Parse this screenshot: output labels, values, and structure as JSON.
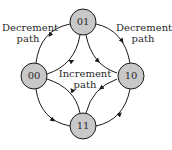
{
  "diagram": {
    "nodes": [
      {
        "id": "01",
        "label": "01"
      },
      {
        "id": "00",
        "label": "00"
      },
      {
        "id": "10",
        "label": "10"
      },
      {
        "id": "11",
        "label": "11"
      }
    ],
    "labels": {
      "decrement_left_1": "Decrement",
      "decrement_left_2": "path",
      "decrement_right_1": "Decrement",
      "decrement_right_2": "path",
      "increment_1": "Increment",
      "increment_2": "path"
    },
    "edges": [
      {
        "from": "01",
        "to": "00",
        "path": "decrement"
      },
      {
        "from": "00",
        "to": "11",
        "path": "decrement"
      },
      {
        "from": "11",
        "to": "10",
        "path": "decrement"
      },
      {
        "from": "10",
        "to": "01",
        "path": "decrement"
      },
      {
        "from": "00",
        "to": "01",
        "path": "increment"
      },
      {
        "from": "01",
        "to": "10",
        "path": "increment"
      },
      {
        "from": "10",
        "to": "11",
        "path": "increment"
      },
      {
        "from": "11",
        "to": "00",
        "path": "increment"
      }
    ],
    "colors": {
      "node_fill": "#c8c8c8",
      "stroke": "#1a1a1a"
    }
  }
}
